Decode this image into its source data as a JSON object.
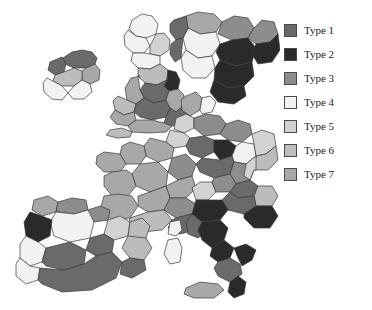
{
  "figure": {
    "width": 372,
    "height": 310,
    "background": "#ffffff",
    "border_color": "#3a3a3a"
  },
  "legend": {
    "name": "map-legend",
    "position": "right",
    "items": [
      {
        "label": "Type 1",
        "color": "#6a6a6a"
      },
      {
        "label": "Type 2",
        "color": "#2a2a2a"
      },
      {
        "label": "Type 3",
        "color": "#8d8d8d"
      },
      {
        "label": "Type 4",
        "color": "#f2f2f2"
      },
      {
        "label": "Type 5",
        "color": "#d2d2d2"
      },
      {
        "label": "Type 6",
        "color": "#bcbcbc"
      },
      {
        "label": "Type 7",
        "color": "#a8a8a8"
      }
    ]
  },
  "chart_data": {
    "type": "map",
    "subtype": "choropleth",
    "title": "",
    "region": "Western and Southern Europe",
    "classification_scheme": "Type 1 - Type 7",
    "class_count": 7,
    "palette": [
      "#6a6a6a",
      "#2a2a2a",
      "#8d8d8d",
      "#f2f2f2",
      "#d2d2d2",
      "#bcbcbc",
      "#a8a8a8"
    ],
    "legend_labels": [
      "Type 1",
      "Type 2",
      "Type 3",
      "Type 4",
      "Type 5",
      "Type 6",
      "Type 7"
    ],
    "background": "#ffffff",
    "areas": [
      {
        "name": "ireland-north",
        "type": "Type 1",
        "color": "#6a6a6a",
        "path": "M63,58 L72,52 L82,50 L92,52 L97,58 L95,64 L86,68 L74,68 L65,64 Z"
      },
      {
        "name": "ireland-northwest",
        "type": "Type 1",
        "color": "#6a6a6a",
        "path": "M50,62 L62,57 L66,64 L64,72 L55,75 L48,70 Z"
      },
      {
        "name": "ireland-east",
        "type": "Type 7",
        "color": "#a8a8a8",
        "path": "M86,68 L95,64 L100,70 L99,80 L90,84 L82,80 L82,71 Z"
      },
      {
        "name": "ireland-midwest",
        "type": "Type 6",
        "color": "#bcbcbc",
        "path": "M55,75 L64,72 L74,68 L82,71 L82,80 L74,86 L62,86 L53,81 Z"
      },
      {
        "name": "ireland-southwest",
        "type": "Type 4",
        "color": "#f2f2f2",
        "path": "M47,78 L53,81 L62,86 L68,93 L62,100 L52,99 L44,92 L43,83 Z"
      },
      {
        "name": "ireland-southeast",
        "type": "Type 4",
        "color": "#f2f2f2",
        "path": "M68,93 L74,86 L82,80 L90,84 L92,92 L84,99 L73,99 Z"
      },
      {
        "name": "scotland-highlands",
        "type": "Type 4",
        "color": "#f2f2f2",
        "path": "M132,20 L142,14 L152,16 L158,24 L156,34 L146,38 L136,36 L129,29 Z"
      },
      {
        "name": "scotland-north",
        "type": "Type 4",
        "color": "#f2f2f2",
        "path": "M128,30 L136,36 L146,38 L150,46 L144,53 L133,53 L125,46 L124,36 Z"
      },
      {
        "name": "scotland-east",
        "type": "Type 5",
        "color": "#d2d2d2",
        "path": "M150,46 L156,34 L164,33 L170,40 L169,50 L160,56 L150,54 Z"
      },
      {
        "name": "scotland-south",
        "type": "Type 4",
        "color": "#f2f2f2",
        "path": "M133,53 L144,53 L150,54 L160,56 L160,64 L150,69 L138,68 L131,61 Z"
      },
      {
        "name": "england-north",
        "type": "Type 6",
        "color": "#bcbcbc",
        "path": "M138,68 L150,69 L160,64 L168,70 L167,80 L157,85 L145,83 L138,76 Z"
      },
      {
        "name": "england-northeast",
        "type": "Type 2",
        "color": "#2a2a2a",
        "path": "M167,80 L168,70 L176,72 L180,80 L178,89 L169,91 L164,86 Z"
      },
      {
        "name": "england-yorkshire",
        "type": "Type 1",
        "color": "#6a6a6a",
        "path": "M145,83 L157,85 L167,80 L164,86 L169,91 L166,100 L154,103 L144,98 L140,90 Z"
      },
      {
        "name": "england-northwest",
        "type": "Type 7",
        "color": "#a8a8a8",
        "path": "M131,78 L140,76 L138,76 L140,90 L144,98 L136,104 L127,100 L125,88 Z"
      },
      {
        "name": "wales-north",
        "type": "Type 6",
        "color": "#bcbcbc",
        "path": "M118,96 L127,100 L136,104 L134,112 L124,115 L115,110 L113,101 Z"
      },
      {
        "name": "wales-south",
        "type": "Type 7",
        "color": "#a8a8a8",
        "path": "M115,110 L124,115 L134,112 L136,120 L128,126 L116,124 L110,117 Z"
      },
      {
        "name": "england-midlands",
        "type": "Type 1",
        "color": "#6a6a6a",
        "path": "M136,104 L144,98 L154,103 L166,100 L170,108 L166,117 L152,120 L140,117 L134,112 Z"
      },
      {
        "name": "england-east",
        "type": "Type 7",
        "color": "#a8a8a8",
        "path": "M166,100 L169,91 L178,89 L184,95 L184,105 L176,112 L170,108 Z"
      },
      {
        "name": "england-southeast",
        "type": "Type 1",
        "color": "#6a6a6a",
        "path": "M166,117 L170,108 L176,112 L184,105 L189,112 L184,122 L172,126 L164,123 Z"
      },
      {
        "name": "england-southwest",
        "type": "Type 7",
        "color": "#a8a8a8",
        "path": "M128,126 L136,120 L152,120 L164,123 L172,126 L166,132 L148,133 L132,132 Z"
      },
      {
        "name": "england-cornwall",
        "type": "Type 6",
        "color": "#bcbcbc",
        "path": "M110,130 L122,128 L132,132 L130,137 L117,138 L106,135 Z"
      },
      {
        "name": "norway-north",
        "type": "Type 7",
        "color": "#a8a8a8",
        "path": "M186,16 L198,12 L214,14 L222,22 L216,32 L200,34 L188,28 Z"
      },
      {
        "name": "norway-central",
        "type": "Type 4",
        "color": "#f2f2f2",
        "path": "M188,28 L200,34 L216,32 L220,44 L212,56 L198,58 L186,50 L183,38 Z"
      },
      {
        "name": "norway-south",
        "type": "Type 4",
        "color": "#f2f2f2",
        "path": "M186,50 L198,58 L212,56 L215,68 L206,78 L192,78 L183,70 L181,58 Z"
      },
      {
        "name": "norway-west",
        "type": "Type 1",
        "color": "#6a6a6a",
        "path": "M174,20 L186,16 L188,28 L183,38 L176,40 L170,32 L170,24 Z"
      },
      {
        "name": "norway-southwest",
        "type": "Type 1",
        "color": "#6a6a6a",
        "path": "M176,40 L183,38 L181,58 L175,62 L170,54 L171,44 Z"
      },
      {
        "name": "sweden-north",
        "type": "Type 3",
        "color": "#8d8d8d",
        "path": "M222,22 L234,16 L248,18 L254,28 L248,38 L232,40 L218,34 Z"
      },
      {
        "name": "sweden-central",
        "type": "Type 2",
        "color": "#2a2a2a",
        "path": "M220,44 L232,40 L248,38 L256,48 L252,62 L236,66 L220,60 L216,52 Z"
      },
      {
        "name": "sweden-south",
        "type": "Type 2",
        "color": "#2a2a2a",
        "path": "M215,68 L220,60 L236,66 L252,62 L254,76 L244,86 L228,88 L214,80 Z"
      },
      {
        "name": "sweden-scania",
        "type": "Type 2",
        "color": "#2a2a2a",
        "path": "M214,80 L228,88 L244,86 L246,96 L234,104 L218,102 L210,92 Z"
      },
      {
        "name": "finland-north",
        "type": "Type 3",
        "color": "#8d8d8d",
        "path": "M254,28 L262,20 L274,22 L278,34 L270,42 L256,44 L248,38 Z"
      },
      {
        "name": "finland-south",
        "type": "Type 2",
        "color": "#2a2a2a",
        "path": "M256,44 L270,42 L278,34 L280,50 L272,62 L258,64 L252,54 Z"
      },
      {
        "name": "denmark-jutland",
        "type": "Type 7",
        "color": "#a8a8a8",
        "path": "M186,96 L196,92 L202,98 L200,110 L190,116 L182,110 L181,100 Z"
      },
      {
        "name": "denmark-islands",
        "type": "Type 4",
        "color": "#f2f2f2",
        "path": "M202,98 L210,96 L216,102 L212,112 L202,114 L200,110 Z"
      },
      {
        "name": "netherlands",
        "type": "Type 5",
        "color": "#d2d2d2",
        "path": "M176,118 L186,114 L194,118 L194,128 L184,133 L174,129 Z"
      },
      {
        "name": "belgium",
        "type": "Type 5",
        "color": "#d2d2d2",
        "path": "M170,130 L184,133 L190,138 L186,146 L174,148 L166,142 Z"
      },
      {
        "name": "germany-north",
        "type": "Type 3",
        "color": "#8d8d8d",
        "path": "M194,118 L206,114 L220,116 L226,124 L220,134 L204,136 L194,128 Z"
      },
      {
        "name": "germany-northeast",
        "type": "Type 3",
        "color": "#8d8d8d",
        "path": "M226,124 L238,120 L250,124 L252,134 L242,142 L228,140 L220,134 Z"
      },
      {
        "name": "germany-west",
        "type": "Type 1",
        "color": "#6a6a6a",
        "path": "M190,138 L204,136 L214,140 L214,152 L202,158 L190,154 L186,146 Z"
      },
      {
        "name": "germany-central",
        "type": "Type 2",
        "color": "#2a2a2a",
        "path": "M214,140 L228,140 L236,146 L232,156 L220,160 L214,152 Z"
      },
      {
        "name": "germany-east",
        "type": "Type 4",
        "color": "#f2f2f2",
        "path": "M236,146 L242,142 L254,144 L256,156 L246,164 L234,162 L232,156 Z"
      },
      {
        "name": "germany-south",
        "type": "Type 1",
        "color": "#6a6a6a",
        "path": "M202,158 L220,160 L232,156 L234,162 L230,174 L214,178 L200,172 L196,164 Z"
      },
      {
        "name": "germany-southeast",
        "type": "Type 3",
        "color": "#8d8d8d",
        "path": "M234,162 L246,164 L254,170 L250,180 L236,184 L230,174 Z"
      },
      {
        "name": "poland-west",
        "type": "Type 5",
        "color": "#d2d2d2",
        "path": "M252,134 L262,130 L274,134 L276,146 L266,154 L256,156 L254,144 Z"
      },
      {
        "name": "poland-south",
        "type": "Type 6",
        "color": "#bcbcbc",
        "path": "M256,156 L266,154 L276,146 L278,160 L268,170 L256,170 L254,170 Z"
      },
      {
        "name": "czech",
        "type": "Type 5",
        "color": "#d2d2d2",
        "path": "M246,164 L256,156 L256,170 L254,170 L250,180 L244,176 Z"
      },
      {
        "name": "france-north",
        "type": "Type 7",
        "color": "#a8a8a8",
        "path": "M150,138 L166,142 L174,148 L172,158 L158,162 L146,156 L144,146 Z"
      },
      {
        "name": "france-normandy",
        "type": "Type 7",
        "color": "#a8a8a8",
        "path": "M130,142 L144,146 L146,156 L140,164 L126,164 L120,154 L122,146 Z"
      },
      {
        "name": "france-brittany",
        "type": "Type 7",
        "color": "#a8a8a8",
        "path": "M104,152 L120,154 L126,164 L120,172 L104,172 L96,164 L97,156 Z"
      },
      {
        "name": "france-east",
        "type": "Type 3",
        "color": "#8d8d8d",
        "path": "M172,158 L186,154 L196,164 L192,176 L178,180 L168,172 Z"
      },
      {
        "name": "france-centre",
        "type": "Type 7",
        "color": "#a8a8a8",
        "path": "M140,164 L158,162 L168,172 L166,186 L150,192 L136,186 L132,174 Z"
      },
      {
        "name": "france-west",
        "type": "Type 7",
        "color": "#a8a8a8",
        "path": "M112,172 L126,170 L132,174 L136,186 L128,196 L112,196 L104,186 L104,176 Z"
      },
      {
        "name": "france-burgundy",
        "type": "Type 7",
        "color": "#a8a8a8",
        "path": "M166,186 L178,180 L192,176 L196,188 L186,198 L170,198 Z"
      },
      {
        "name": "france-aquitaine",
        "type": "Type 7",
        "color": "#a8a8a8",
        "path": "M104,196 L118,194 L132,196 L138,206 L130,218 L112,220 L100,210 Z"
      },
      {
        "name": "france-auvergne",
        "type": "Type 7",
        "color": "#a8a8a8",
        "path": "M138,196 L150,192 L166,186 L170,198 L164,210 L148,212 L138,206 Z"
      },
      {
        "name": "france-rhone",
        "type": "Type 3",
        "color": "#8d8d8d",
        "path": "M170,198 L186,198 L196,204 L192,214 L176,218 L164,210 Z"
      },
      {
        "name": "france-midi",
        "type": "Type 6",
        "color": "#bcbcbc",
        "path": "M130,218 L148,212 L164,210 L172,220 L162,230 L142,232 L128,226 Z"
      },
      {
        "name": "france-paca",
        "type": "Type 1",
        "color": "#6a6a6a",
        "path": "M172,220 L176,218 L192,214 L200,220 L196,230 L180,234 L168,228 Z"
      },
      {
        "name": "switzerland",
        "type": "Type 5",
        "color": "#d2d2d2",
        "path": "M192,188 L200,182 L212,182 L216,192 L208,200 L196,200 Z"
      },
      {
        "name": "austria-west",
        "type": "Type 3",
        "color": "#8d8d8d",
        "path": "M214,178 L230,174 L236,184 L230,192 L216,192 L212,182 Z"
      },
      {
        "name": "austria-east",
        "type": "Type 1",
        "color": "#6a6a6a",
        "path": "M236,184 L250,180 L258,186 L254,196 L238,198 L230,192 Z"
      },
      {
        "name": "hungary",
        "type": "Type 6",
        "color": "#bcbcbc",
        "path": "M254,196 L258,186 L272,186 L278,196 L272,206 L256,206 Z"
      },
      {
        "name": "slovenia-croatia",
        "type": "Type 1",
        "color": "#6a6a6a",
        "path": "M230,192 L238,198 L254,196 L256,206 L244,214 L228,210 L222,200 Z"
      },
      {
        "name": "balkans-east",
        "type": "Type 2",
        "color": "#2a2a2a",
        "path": "M256,206 L272,206 L278,216 L270,228 L254,228 L244,218 L244,214 Z"
      },
      {
        "name": "italy-north",
        "type": "Type 2",
        "color": "#2a2a2a",
        "path": "M196,200 L208,200 L222,200 L228,210 L220,220 L202,222 L192,214 Z"
      },
      {
        "name": "italy-northwest",
        "type": "Type 1",
        "color": "#6a6a6a",
        "path": "M192,214 L202,222 L206,232 L198,238 L188,234 L186,222 Z"
      },
      {
        "name": "italy-centre",
        "type": "Type 2",
        "color": "#2a2a2a",
        "path": "M202,222 L220,220 L228,228 L224,240 L212,248 L202,240 L198,230 Z"
      },
      {
        "name": "italy-abruzzo",
        "type": "Type 2",
        "color": "#2a2a2a",
        "path": "M212,248 L224,240 L234,248 L230,258 L218,262 L210,256 Z"
      },
      {
        "name": "italy-south",
        "type": "Type 1",
        "color": "#6a6a6a",
        "path": "M218,262 L230,258 L240,264 L242,274 L230,282 L218,276 L214,268 Z"
      },
      {
        "name": "italy-puglia",
        "type": "Type 2",
        "color": "#2a2a2a",
        "path": "M234,248 L246,244 L256,250 L252,260 L242,266 L238,258 Z"
      },
      {
        "name": "italy-calabria",
        "type": "Type 2",
        "color": "#2a2a2a",
        "path": "M230,282 L238,276 L246,282 L244,294 L234,298 L228,292 Z"
      },
      {
        "name": "italy-sicily",
        "type": "Type 7",
        "color": "#a8a8a8",
        "path": "M186,288 L200,282 L218,284 L224,290 L214,298 L194,298 L184,294 Z"
      },
      {
        "name": "italy-sardinia",
        "type": "Type 4",
        "color": "#f2f2f2",
        "path": "M168,240 L178,238 L182,248 L180,262 L170,264 L164,254 Z"
      },
      {
        "name": "corsica",
        "type": "Type 4",
        "color": "#f2f2f2",
        "path": "M170,222 L180,220 L182,230 L176,236 L168,234 Z"
      },
      {
        "name": "spain-galicia",
        "type": "Type 7",
        "color": "#a8a8a8",
        "path": "M34,200 L48,196 L58,202 L56,212 L42,216 L32,210 Z"
      },
      {
        "name": "spain-asturias",
        "type": "Type 3",
        "color": "#8d8d8d",
        "path": "M58,202 L72,198 L86,200 L88,210 L74,214 L58,212 L56,212 Z"
      },
      {
        "name": "spain-basque",
        "type": "Type 3",
        "color": "#8d8d8d",
        "path": "M88,210 L100,206 L110,210 L108,220 L94,222 L86,218 Z"
      },
      {
        "name": "spain-castilla-leon",
        "type": "Type 4",
        "color": "#f2f2f2",
        "path": "M56,212 L74,214 L88,210 L94,222 L90,238 L70,242 L54,236 L50,222 Z"
      },
      {
        "name": "spain-aragon",
        "type": "Type 5",
        "color": "#d2d2d2",
        "path": "M108,220 L120,216 L130,222 L128,236 L114,240 L104,234 Z"
      },
      {
        "name": "spain-catalonia",
        "type": "Type 6",
        "color": "#bcbcbc",
        "path": "M130,222 L142,218 L150,226 L146,238 L132,240 L128,236 Z"
      },
      {
        "name": "portugal-north",
        "type": "Type 2",
        "color": "#2a2a2a",
        "path": "M30,212 L42,216 L52,220 L50,236 L38,242 L26,236 L24,222 Z"
      },
      {
        "name": "portugal-centre",
        "type": "Type 4",
        "color": "#f2f2f2",
        "path": "M26,236 L38,242 L46,248 L42,262 L30,266 L20,258 L20,244 Z"
      },
      {
        "name": "portugal-south",
        "type": "Type 4",
        "color": "#f2f2f2",
        "path": "M20,258 L30,266 L40,268 L38,280 L26,284 L16,276 L16,264 Z"
      },
      {
        "name": "spain-madrid",
        "type": "Type 1",
        "color": "#6a6a6a",
        "path": "M90,238 L104,234 L114,240 L112,252 L96,256 L86,250 Z"
      },
      {
        "name": "spain-valencia",
        "type": "Type 6",
        "color": "#bcbcbc",
        "path": "M128,236 L146,238 L152,248 L144,260 L130,258 L122,248 Z"
      },
      {
        "name": "spain-extremadura",
        "type": "Type 1",
        "color": "#6a6a6a",
        "path": "M46,248 L70,242 L86,250 L84,264 L64,270 L46,266 L42,262 Z"
      },
      {
        "name": "spain-andalucia",
        "type": "Type 1",
        "color": "#6a6a6a",
        "path": "M40,268 L64,270 L84,264 L96,256 L112,252 L122,262 L116,278 L92,290 L62,292 L42,284 L38,280 Z"
      },
      {
        "name": "spain-murcia",
        "type": "Type 1",
        "color": "#6a6a6a",
        "path": "M122,262 L130,258 L144,260 L146,270 L132,278 L120,274 Z"
      },
      {
        "name": "greece-mainland",
        "type": "Type 2",
        "color": "#2a2a2a",
        "path": "M300,248 L312,240 L320,246 L330,240 L338,246 L344,238 L352,242 L348,254 L338,258 L340,268 L330,272 L322,266 L312,274 L300,276 L294,266 L294,254 Z"
      },
      {
        "name": "greece-crete",
        "type": "Type 4",
        "color": "#f2f2f2",
        "path": "M334,286 L350,284 L358,288 L350,293 L334,293 L328,289 Z"
      }
    ]
  }
}
